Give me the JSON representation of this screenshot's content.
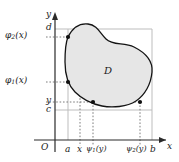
{
  "figure": {
    "region_label": "D",
    "origin_label": "O",
    "axes": {
      "x_axis_label": "x",
      "y_axis_label": "y"
    },
    "y_ticks": [
      {
        "key": "d",
        "text_main": "d",
        "text_sub": "",
        "text_tail": ""
      },
      {
        "key": "phi2",
        "text_main": "φ",
        "text_sub": "2",
        "text_tail": "(x)"
      },
      {
        "key": "phi1",
        "text_main": "φ",
        "text_sub": "1",
        "text_tail": "(x)"
      },
      {
        "key": "y",
        "text_main": "y",
        "text_sub": "",
        "text_tail": ""
      },
      {
        "key": "c",
        "text_main": "c",
        "text_sub": "",
        "text_tail": ""
      }
    ],
    "x_ticks": [
      {
        "key": "a",
        "text_main": "a",
        "text_sub": "",
        "text_tail": ""
      },
      {
        "key": "x",
        "text_main": "x",
        "text_sub": "",
        "text_tail": ""
      },
      {
        "key": "psi1",
        "text_main": "ψ",
        "text_sub": "1",
        "text_tail": "(y)"
      },
      {
        "key": "psi2",
        "text_main": "ψ",
        "text_sub": "2",
        "text_tail": "(y)"
      },
      {
        "key": "b",
        "text_main": "b",
        "text_sub": "",
        "text_tail": ""
      }
    ],
    "colors": {
      "axis": "#2a2a2a",
      "curve": "#111111",
      "region_fill": "#e6e6e6",
      "guide_gray": "#b9b9b9",
      "guide_dotted": "#8f8f8f",
      "point": "#111111",
      "text": "#1a1a1a"
    },
    "points": [
      {
        "name": "point-phi2-x",
        "x": 68,
        "y": 37
      },
      {
        "name": "point-phi1-x",
        "x": 68,
        "y": 82
      },
      {
        "name": "point-psi1-y",
        "x": 93,
        "y": 102
      },
      {
        "name": "point-psi2-y",
        "x": 140,
        "y": 102
      }
    ],
    "geometry": {
      "y_axis_x": 55,
      "x_axis_y": 140,
      "a_x": 68,
      "x_x": 80,
      "psi1_x": 93,
      "psi2_x": 140,
      "b_x": 152,
      "d_y": 29,
      "phi2_y": 37,
      "phi1_y": 82,
      "y_y": 102,
      "c_y": 110
    }
  }
}
